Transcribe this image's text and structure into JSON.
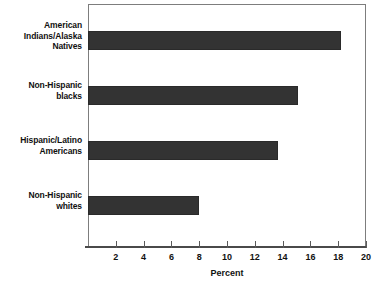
{
  "chart_data": {
    "type": "bar",
    "orientation": "horizontal",
    "title": "",
    "xlabel": "Percent",
    "ylabel": "",
    "categories": [
      "American Indians/Alaska Natives",
      "Non-Hispanic blacks",
      "Hispanic/Latino Americans",
      "Non-Hispanic whites"
    ],
    "category_lines": [
      [
        "American",
        "Indians/Alaska",
        "Natives"
      ],
      [
        "Non-Hispanic",
        "blacks"
      ],
      [
        "Hispanic/Latino",
        "Americans"
      ],
      [
        "Non-Hispanic",
        "whites"
      ]
    ],
    "values": [
      18.2,
      15.1,
      13.7,
      8.0
    ],
    "xlim": [
      0,
      20
    ],
    "xticks": [
      2,
      4,
      6,
      8,
      10,
      12,
      14,
      16,
      18,
      20
    ],
    "xtick_labels": [
      "2",
      "4",
      "6",
      "8",
      "10",
      "12",
      "14",
      "16",
      "18",
      "20"
    ],
    "grid": false,
    "legend": null,
    "bar_color": "#333333",
    "frame_color": "#7d7d7d",
    "axis_color": "#4a4a4a"
  }
}
